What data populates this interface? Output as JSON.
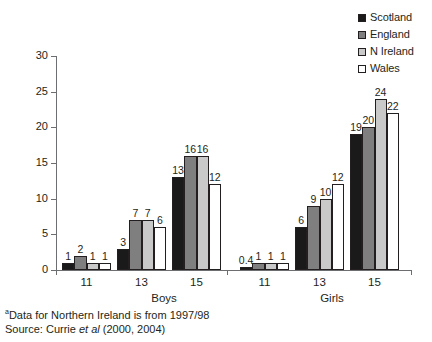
{
  "chart_data": {
    "type": "bar",
    "title": "",
    "xlabel": "",
    "ylabel": "",
    "ylim": [
      0,
      30
    ],
    "ytick_values": [
      0,
      5,
      10,
      15,
      20,
      25,
      30
    ],
    "ytick_labels": [
      "0",
      "5",
      "10",
      "15",
      "20",
      "25",
      "30"
    ],
    "grid": false,
    "legend_position": "top-right",
    "categories": [
      "11",
      "13",
      "15",
      "11",
      "13",
      "15"
    ],
    "group_labels": [
      "Boys",
      "Girls"
    ],
    "series": [
      {
        "name": "Scotland",
        "color": "#1a1a1a",
        "values": [
          1,
          3,
          13,
          0.4,
          6,
          19
        ],
        "labels": [
          "1",
          "3",
          "13",
          "0.4",
          "6",
          "19"
        ]
      },
      {
        "name": "England",
        "color": "#7f7f7f",
        "values": [
          2,
          7,
          16,
          1,
          9,
          20
        ],
        "labels": [
          "2",
          "7",
          "16",
          "1",
          "9",
          "20"
        ]
      },
      {
        "name": "N Ireland",
        "color": "#c9c9c9",
        "values": [
          1,
          7,
          16,
          1,
          10,
          24
        ],
        "labels": [
          "1",
          "7",
          "16",
          "1",
          "10",
          "24"
        ]
      },
      {
        "name": "Wales",
        "color": "#ffffff",
        "values": [
          1,
          6,
          12,
          1,
          12,
          22
        ],
        "labels": [
          "1",
          "6",
          "12",
          "1",
          "12",
          "22"
        ]
      }
    ]
  },
  "legend": {
    "items": [
      {
        "label": "Scotland",
        "color": "#1a1a1a"
      },
      {
        "label": "England",
        "color": "#7f7f7f"
      },
      {
        "label": "N Ireland",
        "color": "#c9c9c9"
      },
      {
        "label": "Wales",
        "color": "#ffffff"
      }
    ]
  },
  "axis": {
    "x_group_labels": [
      {
        "text": "11"
      },
      {
        "text": "13"
      },
      {
        "text": "15"
      },
      {
        "text": "11"
      },
      {
        "text": "13"
      },
      {
        "text": "15"
      }
    ],
    "sex_labels": [
      {
        "text": "Boys"
      },
      {
        "text": "Girls"
      }
    ]
  },
  "footnotes": {
    "marker": "a",
    "note": "Data for Northern Ireland is from 1997/98",
    "source_prefix": "Source: ",
    "source_author": "Currie ",
    "source_etal": "et al",
    "source_years": " (2000, 2004)"
  }
}
